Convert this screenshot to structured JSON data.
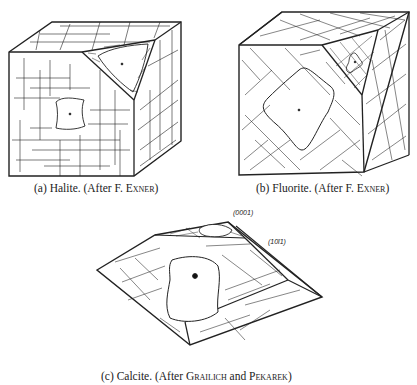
{
  "figures": [
    {
      "id": "a",
      "caption_prefix": "(a) Halite. (After F. ",
      "caption_author": "Exner",
      "caption_suffix": ")",
      "subject": "Halite"
    },
    {
      "id": "b",
      "caption_prefix": "(b) Fluorite. (After F. ",
      "caption_author": "Exner",
      "caption_suffix": ")",
      "subject": "Fluorite"
    },
    {
      "id": "c",
      "caption_prefix": "(c) Calcite. (After ",
      "caption_author": "Grailich",
      "caption_mid": " and ",
      "caption_author2": "Pekarek",
      "caption_suffix": ")",
      "subject": "Calcite",
      "face_labels": [
        "(0001)",
        "(10ī1)"
      ]
    }
  ]
}
